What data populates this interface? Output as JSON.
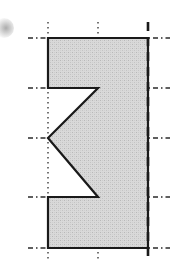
{
  "figure": {
    "canvas": {
      "width": 176,
      "height": 274,
      "background": "#ffffff"
    },
    "style": {
      "outline_color": "#1a1a1a",
      "outline_width": 2.2,
      "fill_color": "#d6d6d6",
      "fill_pattern": "stipple-gray",
      "gridline_color": "#2b2b2b",
      "axis_color": "#1a1a1a"
    },
    "shape": {
      "name": "notched-rectangle-outline",
      "description": "Rectangle with a triangular notch removed from the left side",
      "points": [
        {
          "x": 48,
          "y": 38
        },
        {
          "x": 148,
          "y": 38
        },
        {
          "x": 148,
          "y": 248
        },
        {
          "x": 48,
          "y": 248
        },
        {
          "x": 48,
          "y": 197
        },
        {
          "x": 98,
          "y": 197
        },
        {
          "x": 48,
          "y": 138
        },
        {
          "x": 98,
          "y": 88
        },
        {
          "x": 48,
          "y": 88
        }
      ]
    },
    "symmetry_axis": {
      "name": "vertical-dashed-axis",
      "x": 148,
      "y_start": 22,
      "y_end": 262,
      "dash": "9 6",
      "width": 2.6
    },
    "vertical_gridlines": [
      {
        "name": "grid-v-left",
        "x": 48,
        "y_start": 22,
        "y_end": 262,
        "dash": "1.6 3.4"
      },
      {
        "name": "grid-v-mid",
        "x": 98,
        "y_start": 22,
        "y_end": 262,
        "dash": "1.6 3.4"
      }
    ],
    "horizontal_gridlines": [
      {
        "name": "grid-h-top",
        "y": 38,
        "x_start": 28,
        "x_end": 170,
        "dash": "5 3 1.5 3"
      },
      {
        "name": "grid-h-notch-top",
        "y": 88,
        "x_start": 28,
        "x_end": 170,
        "dash": "5 3 1.5 3"
      },
      {
        "name": "grid-h-center",
        "y": 138,
        "x_start": 28,
        "x_end": 170,
        "dash": "5 3 1.5 3"
      },
      {
        "name": "grid-h-notch-bottom",
        "y": 197,
        "x_start": 28,
        "x_end": 170,
        "dash": "5 3 1.5 3"
      },
      {
        "name": "grid-h-bottom",
        "y": 248,
        "x_start": 28,
        "x_end": 170,
        "dash": "5 3 1.5 3"
      }
    ],
    "artifacts": [
      {
        "name": "scan-smudge-mark",
        "x": 0,
        "y": 18,
        "width": 18,
        "height": 18,
        "color": "rgba(90,90,90,0.30)"
      }
    ]
  }
}
